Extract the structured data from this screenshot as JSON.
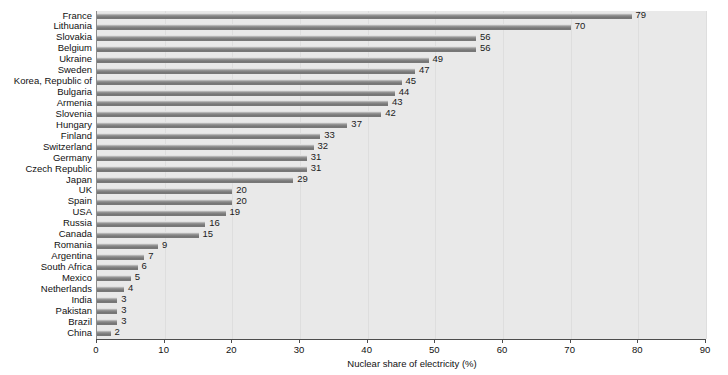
{
  "chart_data": {
    "type": "bar",
    "orientation": "horizontal",
    "title": "",
    "xlabel": "Nuclear share of electricity (%)",
    "ylabel": "",
    "xlim": [
      0,
      90
    ],
    "xticks": [
      0,
      10,
      20,
      30,
      40,
      50,
      60,
      70,
      80,
      90
    ],
    "grid": true,
    "legend": false,
    "show_value_labels": true,
    "categories": [
      "France",
      "Lithuania",
      "Slovakia",
      "Belgium",
      "Ukraine",
      "Sweden",
      "Korea, Republic of",
      "Bulgaria",
      "Armenia",
      "Slovenia",
      "Hungary",
      "Finland",
      "Switzerland",
      "Germany",
      "Czech Republic",
      "Japan",
      "UK",
      "Spain",
      "USA",
      "Russia",
      "Canada",
      "Romania",
      "Argentina",
      "South Africa",
      "Mexico",
      "Netherlands",
      "India",
      "Pakistan",
      "Brazil",
      "China"
    ],
    "values": [
      79,
      70,
      56,
      56,
      49,
      47,
      45,
      44,
      43,
      42,
      37,
      33,
      32,
      31,
      31,
      29,
      20,
      20,
      19,
      16,
      15,
      9,
      7,
      6,
      5,
      4,
      3,
      3,
      3,
      2
    ]
  },
  "colors": {
    "plot_background": "#e9e9e9",
    "bar_fill": "#7e7e7e",
    "bar_highlight": "#f2f2f2",
    "axis": "#4d4d4d",
    "gridline": "#dedede",
    "text": "#111111",
    "page_background": "#ffffff"
  }
}
